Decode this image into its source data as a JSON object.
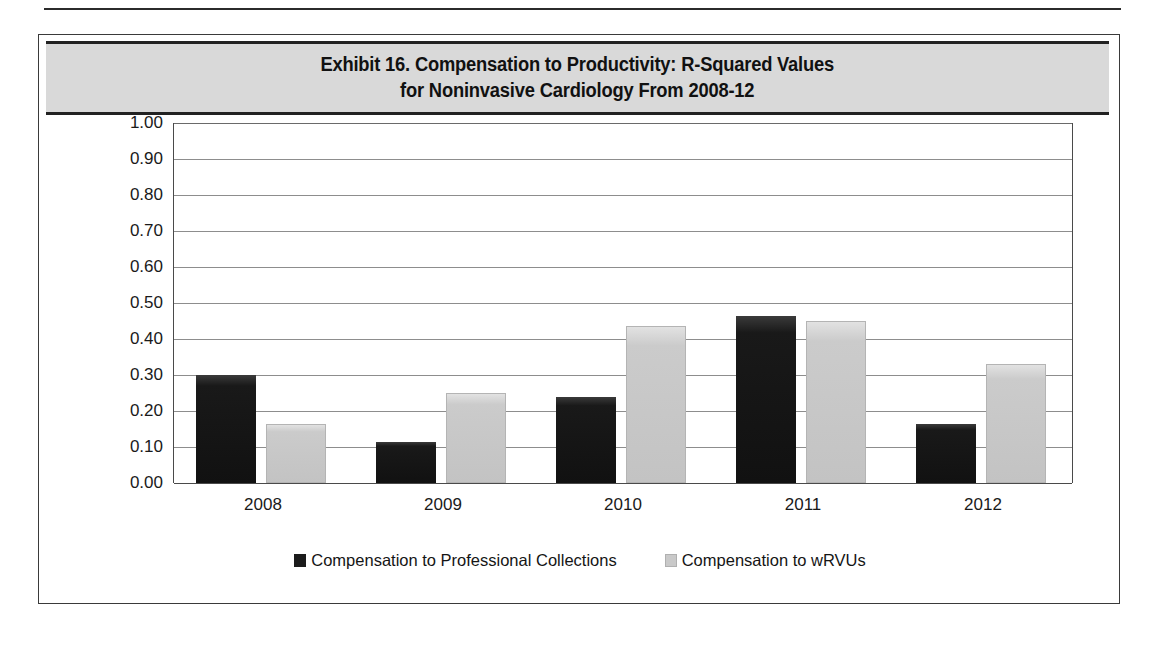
{
  "figure": {
    "title_line1": "Exhibit 16. Compensation to Productivity: R-Squared Values",
    "title_line2": "for Noninvasive Cardiology From 2008-12"
  },
  "chart_data": {
    "type": "bar",
    "title": "Exhibit 16. Compensation to Productivity: R-Squared Values for Noninvasive Cardiology From 2008-12",
    "xlabel": "",
    "ylabel": "",
    "categories": [
      "2008",
      "2009",
      "2010",
      "2011",
      "2012"
    ],
    "series": [
      {
        "name": "Compensation to Professional Collections",
        "color": "#1c1c1c",
        "values": [
          0.3,
          0.115,
          0.24,
          0.465,
          0.165
        ]
      },
      {
        "name": "Compensation to wRVUs",
        "color": "#c9c9c9",
        "values": [
          0.165,
          0.25,
          0.435,
          0.45,
          0.33
        ]
      }
    ],
    "ylim": [
      0.0,
      1.0
    ],
    "ytick_step": 0.1,
    "ytick_labels": [
      "1.00",
      "0.90",
      "0.80",
      "0.70",
      "0.60",
      "0.50",
      "0.40",
      "0.30",
      "0.20",
      "0.10",
      "0.00"
    ],
    "grid": true,
    "legend_position": "bottom"
  },
  "colors": {
    "series_dark": "#1c1c1c",
    "series_light": "#c9c9c9",
    "title_band": "#d9d9d9",
    "gridline": "#8d8d8d",
    "frame": "#3a3a3a"
  }
}
